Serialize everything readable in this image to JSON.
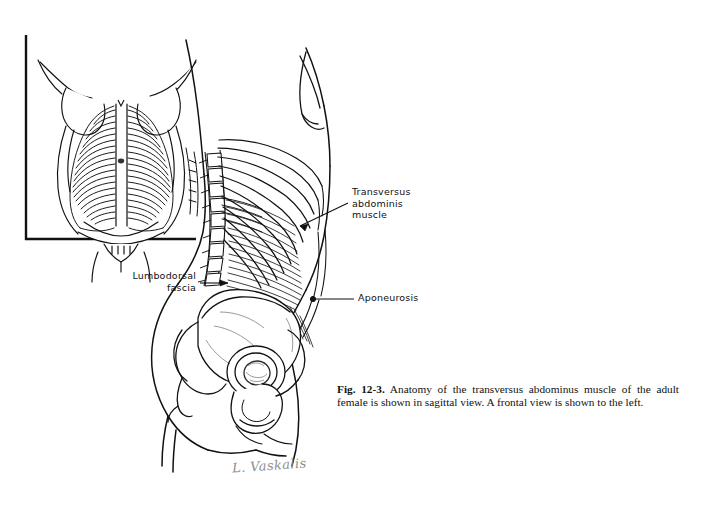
{
  "figure": {
    "caption_number": "Fig. 12-3.",
    "caption_text": " Anatomy of the transversus abdominus muscle of the adult female is shown in sagittal view. A frontal view is shown to the left.",
    "signature": "L. Vaskalis",
    "background_color": "#ffffff",
    "ink_color": "#111111"
  },
  "labels": {
    "transversus": "Transversus\nabdominis\nmuscle",
    "lumbodorsal": "Lumbodorsal\nfascia",
    "aponeurosis": "Aponeurosis"
  },
  "panels": {
    "inset": {
      "name": "frontal-view-inset",
      "description": "frontal view of female torso with transversus abdominis fibers"
    },
    "main": {
      "name": "sagittal-view",
      "description": "sagittal view of adult female trunk with ribs, spine, pelvis and abdominal musculature"
    }
  }
}
